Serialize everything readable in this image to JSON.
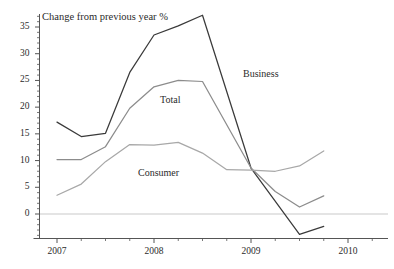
{
  "chart_data": {
    "type": "line",
    "title": "Change from previous year %",
    "xlabel": "",
    "ylabel": "",
    "grid": false,
    "legend_position": "inline-annotations",
    "xlim": [
      2006.85,
      2010.15
    ],
    "ylim": [
      -4.5,
      38.5
    ],
    "yticks": [
      0,
      5,
      10,
      15,
      20,
      25,
      30,
      35
    ],
    "ytick_labels": [
      "0",
      "5",
      "10",
      "15",
      "20",
      "25",
      "30",
      "35"
    ],
    "xticks": [
      2007,
      2008,
      2009,
      2010
    ],
    "xtick_labels": [
      "2007",
      "2008",
      "2009",
      "2010"
    ],
    "zero_line": 0,
    "series": [
      {
        "name": "Business",
        "color": "#3a3a3a",
        "x": [
          2007.0,
          2007.25,
          2007.5,
          2007.75,
          2008.0,
          2008.25,
          2008.5,
          2009.0,
          2009.5,
          2009.75
        ],
        "values": [
          17.2,
          14.5,
          15.1,
          26.5,
          33.5,
          35.2,
          37.2,
          8.6,
          -3.8,
          -2.3
        ]
      },
      {
        "name": "Total",
        "color": "#8c8c8c",
        "x": [
          2007.0,
          2007.25,
          2007.5,
          2007.75,
          2008.0,
          2008.25,
          2008.5,
          2009.0,
          2009.25,
          2009.5,
          2009.75
        ],
        "values": [
          10.2,
          10.2,
          12.6,
          19.8,
          23.8,
          25.0,
          24.8,
          8.6,
          4.2,
          1.3,
          3.4
        ]
      },
      {
        "name": "Consumer",
        "color": "#a8a8a8",
        "x": [
          2007.0,
          2007.25,
          2007.5,
          2007.75,
          2008.0,
          2008.25,
          2008.5,
          2008.75,
          2009.0,
          2009.25,
          2009.5,
          2009.75
        ],
        "values": [
          3.5,
          5.6,
          9.8,
          13.0,
          12.9,
          13.4,
          11.4,
          8.3,
          8.2,
          8.0,
          9.0,
          11.8
        ]
      }
    ],
    "annotations": [
      {
        "name": "Business",
        "text": "Business",
        "x": 2009.0,
        "y": 28.0
      },
      {
        "name": "Total",
        "text": "Total",
        "x": 2008.2,
        "y": 21.6
      },
      {
        "name": "Consumer",
        "text": "Consumer",
        "x": 2008.05,
        "y": 7.6
      }
    ],
    "colors": {
      "business": "#3a3a3a",
      "total": "#8c8c8c",
      "consumer": "#a8a8a8",
      "axis": "#555555",
      "zero_line": "#c9c9c9",
      "background": "#ffffff"
    }
  }
}
